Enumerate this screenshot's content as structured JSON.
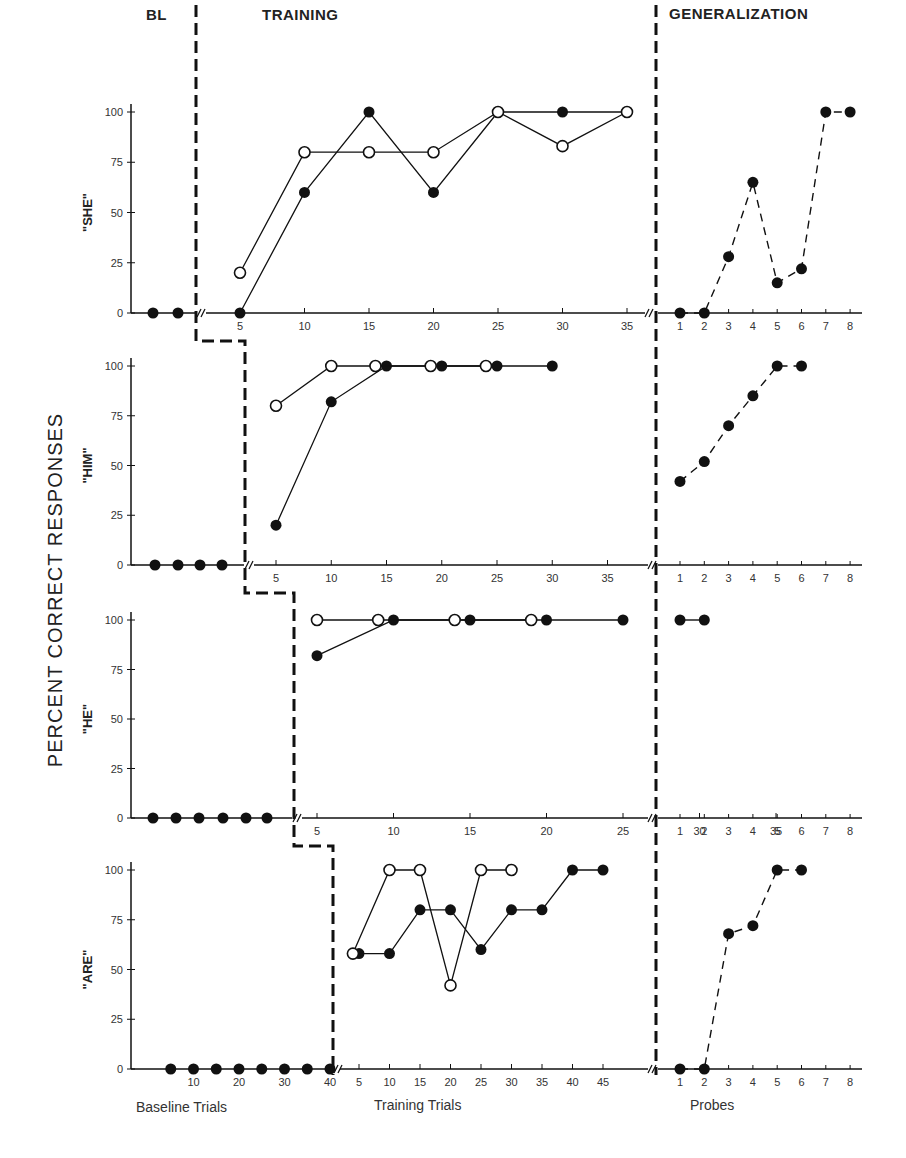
{
  "chart_data": {
    "type": "line",
    "title": "",
    "ylabel": "PERCENT CORRECT RESPONSES",
    "ylim": [
      0,
      100
    ],
    "yticks": [
      0,
      25,
      50,
      75,
      100
    ],
    "phases": [
      "BL",
      "TRAINING",
      "GENERALIZATION"
    ],
    "x_axis_labels": {
      "baseline": "Baseline Trials",
      "training": "Training Trials",
      "generalization": "Probes"
    },
    "legend": [
      {
        "marker": "filled-circle",
        "description": "filled circles (solid line in training, dashed line in generalization)"
      },
      {
        "marker": "open-circle",
        "description": "open circles (solid line)"
      }
    ],
    "panels": [
      {
        "name": "\"SHE\"",
        "baseline": {
          "x": [
            1,
            2
          ],
          "values": [
            0,
            0
          ]
        },
        "training_ticks": [
          5,
          10,
          15,
          20,
          25,
          30,
          35
        ],
        "training": [
          {
            "name": "filled",
            "x": [
              5,
              10,
              15,
              20,
              25,
              30,
              35
            ],
            "values": [
              0,
              60,
              100,
              60,
              100,
              100,
              100
            ]
          },
          {
            "name": "open",
            "x": [
              5,
              10,
              15,
              20,
              25,
              30,
              35
            ],
            "values": [
              20,
              80,
              80,
              80,
              100,
              83,
              100
            ]
          }
        ],
        "generalization_ticks": [
          1,
          2,
          3,
          4,
          5,
          6,
          7,
          8
        ],
        "generalization": {
          "x": [
            1,
            2,
            3,
            4,
            5,
            6,
            7,
            8
          ],
          "values": [
            0,
            0,
            28,
            65,
            15,
            22,
            100,
            100
          ]
        }
      },
      {
        "name": "\"HIM\"",
        "baseline": {
          "x": [
            1,
            2,
            3,
            4
          ],
          "values": [
            0,
            0,
            0,
            0
          ]
        },
        "training_ticks": [
          5,
          10,
          15,
          20,
          25,
          30,
          35
        ],
        "training": [
          {
            "name": "filled",
            "x": [
              5,
              10,
              15,
              20,
              25,
              30
            ],
            "values": [
              20,
              82,
              100,
              100,
              100,
              100
            ]
          },
          {
            "name": "open",
            "x": [
              5,
              10,
              14,
              19,
              24
            ],
            "values": [
              80,
              100,
              100,
              100,
              100
            ]
          }
        ],
        "generalization_ticks": [
          1,
          2,
          3,
          4,
          5,
          6,
          7,
          8
        ],
        "generalization": {
          "x": [
            1,
            2,
            3,
            4,
            5,
            6
          ],
          "values": [
            42,
            52,
            70,
            85,
            100,
            100
          ]
        }
      },
      {
        "name": "\"HE\"",
        "baseline": {
          "x": [
            1,
            2,
            3,
            4,
            5,
            6
          ],
          "values": [
            0,
            0,
            0,
            0,
            0,
            0
          ]
        },
        "training_ticks": [
          5,
          10,
          15,
          20,
          25,
          30,
          35
        ],
        "training": [
          {
            "name": "filled",
            "x": [
              5,
              10,
              15,
              20,
              25
            ],
            "values": [
              82,
              100,
              100,
              100,
              100
            ]
          },
          {
            "name": "open",
            "x": [
              5,
              9,
              14,
              19
            ],
            "values": [
              100,
              100,
              100,
              100
            ]
          }
        ],
        "generalization_ticks": [
          1,
          2,
          3,
          4,
          5,
          6,
          7,
          8
        ],
        "generalization": {
          "x": [
            1,
            2
          ],
          "values": [
            100,
            100
          ]
        }
      },
      {
        "name": "\"ARE\"",
        "baseline_ticks": [
          10,
          20,
          30,
          40
        ],
        "baseline": {
          "x": [
            5,
            10,
            15,
            20,
            25,
            30,
            35,
            40
          ],
          "values": [
            0,
            0,
            0,
            0,
            0,
            0,
            0,
            0
          ]
        },
        "training_ticks": [
          5,
          10,
          15,
          20,
          25,
          30,
          35,
          40,
          45
        ],
        "training": [
          {
            "name": "filled",
            "x": [
              5,
              10,
              15,
              20,
              25,
              30,
              35,
              40,
              45
            ],
            "values": [
              58,
              58,
              80,
              80,
              60,
              80,
              80,
              100,
              100
            ]
          },
          {
            "name": "open",
            "x": [
              4,
              10,
              15,
              20,
              25,
              30
            ],
            "values": [
              58,
              100,
              100,
              42,
              100,
              100
            ]
          }
        ],
        "generalization_ticks": [
          1,
          2,
          3,
          4,
          5,
          6,
          7,
          8
        ],
        "generalization": {
          "x": [
            1,
            2,
            3,
            4,
            5,
            6
          ],
          "values": [
            0,
            0,
            68,
            72,
            100,
            100
          ]
        }
      }
    ]
  },
  "labels": {
    "phase_bl": "BL",
    "phase_training": "TRAINING",
    "phase_generalization": "GENERALIZATION",
    "ylabel": "PERCENT CORRECT RESPONSES",
    "baseline_trials": "Baseline Trials",
    "training_trials": "Training Trials",
    "probes": "Probes"
  }
}
